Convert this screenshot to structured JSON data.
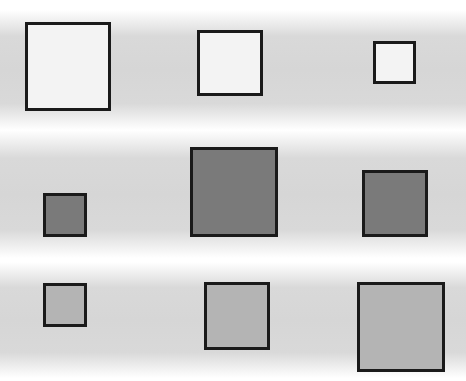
{
  "canvas": {
    "width": 466,
    "height": 381,
    "background": "#ffffff"
  },
  "bands": [
    {
      "top": 10,
      "height": 120
    },
    {
      "top": 130,
      "height": 128
    },
    {
      "top": 262,
      "height": 116
    }
  ],
  "rows": [
    {
      "fill": "#f3f3f3",
      "squares": [
        {
          "x": 25,
          "y": 22,
          "w": 86,
          "h": 89
        },
        {
          "x": 197,
          "y": 30,
          "w": 66,
          "h": 66
        },
        {
          "x": 373,
          "y": 41,
          "w": 43,
          "h": 43
        }
      ]
    },
    {
      "fill": "#7a7a7a",
      "squares": [
        {
          "x": 43,
          "y": 193,
          "w": 44,
          "h": 44
        },
        {
          "x": 190,
          "y": 147,
          "w": 88,
          "h": 90
        },
        {
          "x": 362,
          "y": 170,
          "w": 66,
          "h": 67
        }
      ]
    },
    {
      "fill": "#b4b4b4",
      "squares": [
        {
          "x": 43,
          "y": 283,
          "w": 44,
          "h": 44
        },
        {
          "x": 204,
          "y": 282,
          "w": 66,
          "h": 68
        },
        {
          "x": 357,
          "y": 282,
          "w": 88,
          "h": 90
        }
      ]
    }
  ]
}
